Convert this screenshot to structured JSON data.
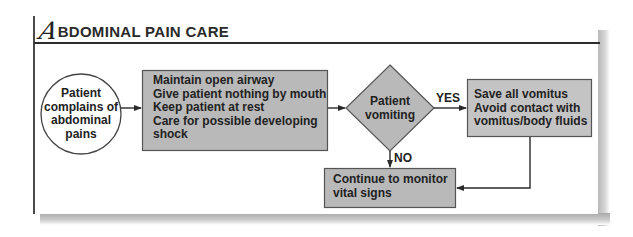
{
  "title": {
    "initial": "A",
    "rest": "BDOMINAL PAIN CARE"
  },
  "colors": {
    "box_fill": "#b9b9b9",
    "box_border": "#555555",
    "line": "#2a2a2a",
    "circle_fill": "#ffffff"
  },
  "nodes": {
    "start": {
      "lines": [
        "Patient",
        "complains of",
        "abdominal",
        "pains"
      ]
    },
    "initial_care": {
      "lines": [
        "Maintain open airway",
        "Give patient nothing by mouth",
        "Keep patient at rest",
        "Care for possible developing",
        "shock"
      ]
    },
    "decision": {
      "lines": [
        "Patient",
        "vomiting"
      ]
    },
    "vomiting_care": {
      "lines": [
        "Save  all vomitus",
        "Avoid contact with",
        "vomitus/body fluids"
      ]
    },
    "monitor": {
      "lines": [
        "Continue to monitor",
        "vital signs"
      ]
    }
  },
  "edges": {
    "yes_label": "YES",
    "no_label": "NO"
  }
}
